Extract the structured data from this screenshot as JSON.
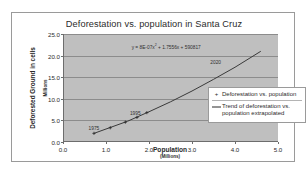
{
  "chart_data": {
    "type": "line",
    "title": "Deforestation vs. population in Santa Cruz",
    "xlabel": "Population",
    "xlabel_sub": "(Millions)",
    "ylabel": "Deforested Ground in cells",
    "ylabel_sub": "Millions",
    "xlim": [
      0.0,
      5.0
    ],
    "ylim": [
      0.0,
      25.0
    ],
    "xticks": [
      "0.0",
      "1.0",
      "2.0",
      "3.0",
      "4.0",
      "5.0"
    ],
    "xtick_values": [
      0.0,
      1.0,
      2.0,
      3.0,
      4.0,
      5.0
    ],
    "yticks": [
      "0.0",
      "5.0",
      "10.0",
      "15.0",
      "20.0",
      "25.0"
    ],
    "ytick_values": [
      0.0,
      5.0,
      10.0,
      15.0,
      20.0,
      25.0
    ],
    "grid": "horizontal",
    "legend_position": "right-middle",
    "plot_background": "#bfbfbf",
    "series": [
      {
        "name": "Deforestation vs. population",
        "marker": "+",
        "type": "scatter",
        "x": [
          0.72,
          1.1,
          1.45,
          1.72,
          1.95
        ],
        "y": [
          2.0,
          3.3,
          4.6,
          5.7,
          6.8
        ]
      },
      {
        "name": "Trend of deforestation vs. population extrapolated",
        "marker": "line",
        "type": "line",
        "x": [
          0.72,
          1.5,
          2.0,
          2.5,
          3.0,
          3.5,
          4.0,
          4.6
        ],
        "y": [
          2.0,
          4.8,
          7.0,
          9.3,
          11.8,
          14.5,
          17.3,
          21.0
        ]
      }
    ],
    "annotations": [
      {
        "text": "y = 8E-07x",
        "exponent": "2",
        "rest": " + 1.7556x + 590817",
        "full": "y = 8E-07x2 + 1.7556x + 590817",
        "x": 2.2,
        "y": 23.0
      },
      {
        "text": "1975",
        "x": 0.72,
        "y": 3.3
      },
      {
        "text": "1995",
        "x": 1.68,
        "y": 6.7
      },
      {
        "text": "2020",
        "x": 3.55,
        "y": 18.6
      }
    ],
    "legend": [
      {
        "key": "+",
        "label": "Deforestation vs. population"
      },
      {
        "key": "line",
        "label": "Trend of deforestation vs. population extrapolated"
      }
    ]
  }
}
